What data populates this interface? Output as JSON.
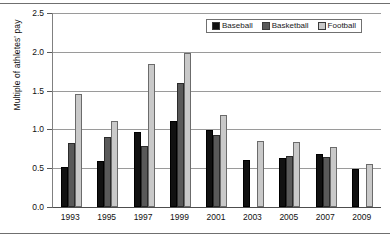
{
  "chart_data": {
    "type": "bar",
    "title": "",
    "subtitle": "",
    "xlabel": "",
    "ylabel": "Multiple of athletes' pay",
    "categories": [
      "1993",
      "1995",
      "1997",
      "1999",
      "2001",
      "2003",
      "2005",
      "2007",
      "2009"
    ],
    "series": [
      {
        "name": "Baseball",
        "color": "#111111",
        "values": [
          0.52,
          0.59,
          0.97,
          1.11,
          0.99,
          0.6,
          0.63,
          0.68,
          0.49
        ]
      },
      {
        "name": "Basketball",
        "color": "#595959",
        "values": [
          0.82,
          0.9,
          0.78,
          1.6,
          0.93,
          null,
          0.66,
          0.65,
          null
        ]
      },
      {
        "name": "Football",
        "color": "#c9c9c9",
        "values": [
          1.46,
          1.11,
          1.84,
          1.98,
          1.19,
          0.85,
          0.84,
          0.77,
          0.55
        ]
      }
    ],
    "ylim": [
      0.0,
      2.5
    ],
    "ytick_labels": [
      "0.0",
      "0.5",
      "1.0",
      "1.5",
      "2.0",
      "2.5"
    ],
    "ytick_values": [
      0.0,
      0.5,
      1.0,
      1.5,
      2.0,
      2.5
    ],
    "grid": true,
    "legend_position": "top-right",
    "legend_entries": [
      "Baseball",
      "Basketball",
      "Football"
    ]
  }
}
